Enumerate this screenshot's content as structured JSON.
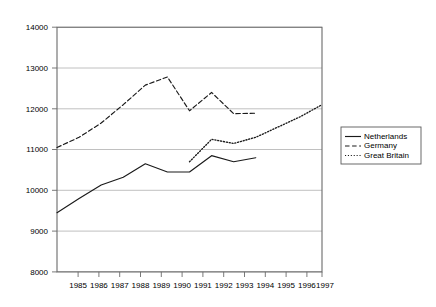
{
  "chart_data": {
    "type": "line",
    "title": "",
    "xlabel": "",
    "ylabel": "",
    "x": [
      1985,
      1986,
      1987,
      1988,
      1989,
      1990,
      1991,
      1992,
      1993,
      1994,
      1995,
      1996,
      1997
    ],
    "xtick_labels": [
      "1985",
      "1986",
      "1987",
      "1988",
      "1989",
      "1990",
      "1991",
      "1992",
      "1993",
      "1994",
      "1995",
      "1996",
      "1997"
    ],
    "ytick_labels": [
      "8000",
      "9000",
      "10000",
      "11000",
      "12000",
      "13000",
      "14000"
    ],
    "yticks": [
      8000,
      9000,
      10000,
      11000,
      12000,
      13000,
      14000
    ],
    "ylim": [
      8000,
      14000
    ],
    "xlim": [
      1985,
      1997
    ],
    "grid": "horizontal",
    "legend_position": "right-outside",
    "series": [
      {
        "name": "Netherlands",
        "style": "solid",
        "x": [
          1985,
          1986,
          1987,
          1988,
          1989,
          1990,
          1991,
          1992,
          1993,
          1994
        ],
        "values": [
          9450,
          9800,
          10130,
          10320,
          10650,
          10450,
          10450,
          10850,
          10700,
          10800
        ]
      },
      {
        "name": "Germany",
        "style": "dashed",
        "x": [
          1985,
          1986,
          1987,
          1988,
          1989,
          1990,
          1991,
          1992,
          1993,
          1994
        ],
        "values": [
          11050,
          11300,
          11650,
          12100,
          12580,
          12780,
          11950,
          12400,
          11880,
          11890
        ]
      },
      {
        "name": "Great Britain",
        "style": "dotted",
        "x": [
          1991,
          1992,
          1993,
          1994,
          1995,
          1996,
          1997
        ],
        "values": [
          10700,
          11250,
          11150,
          11300,
          11550,
          11800,
          12100
        ]
      }
    ],
    "legend": [
      {
        "label": "Netherlands",
        "style": "solid"
      },
      {
        "label": "Germany",
        "style": "dashed"
      },
      {
        "label": "Great Britain",
        "style": "dotted"
      }
    ],
    "colors": {
      "series": "#1a1a1a",
      "grid": "#b0b0b0",
      "axis": "#6b6b6b",
      "background": "#ffffff"
    }
  }
}
